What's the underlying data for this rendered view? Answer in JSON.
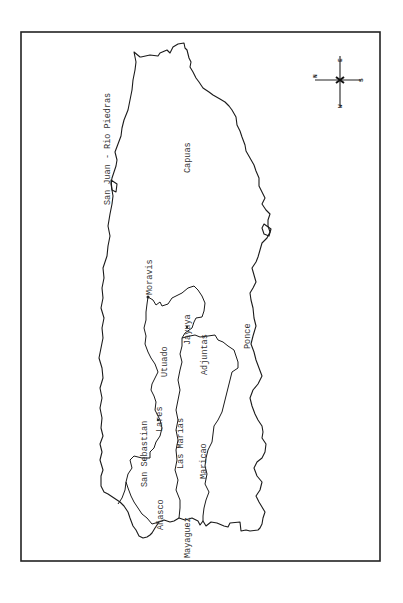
{
  "map": {
    "subject": "Puerto Rico (rotated 90°)",
    "labels": {
      "san_juan": "San Juan - Rio Piedras",
      "caguas": "Capuas",
      "moravis": "Moravis",
      "utuado": "Utuado",
      "jayuya": "Jayuya",
      "adjuntas": "Adjuntas",
      "ponce": "Ponce",
      "lares": "Lares",
      "san_sebastian": "San Sebastian",
      "las_marias": "Las Marias",
      "maricao": "Maricao",
      "anasco": "Añasco",
      "mayaguez": "Mayaguez"
    },
    "compass": {
      "north": "N",
      "south": "S",
      "east": "E",
      "west": "W"
    }
  }
}
